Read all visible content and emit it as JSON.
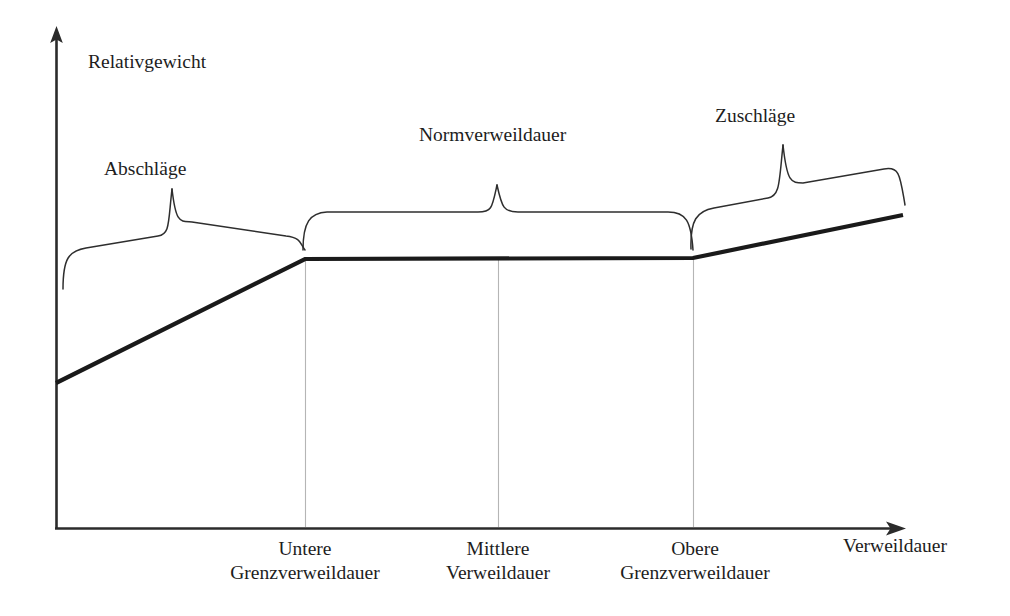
{
  "chart_data": {
    "type": "line",
    "title": "",
    "xlabel": "Verweildauer",
    "ylabel": "Relativgewicht",
    "grid": false,
    "legend_position": "none",
    "axis_arrows": true,
    "x_tick_labels": [
      {
        "id": "untere",
        "line1": "Untere",
        "line2": "Grenzverweildauer",
        "x_px": 305
      },
      {
        "id": "mittlere",
        "line1": "Mittlere",
        "line2": "Verweildauer",
        "x_px": 498
      },
      {
        "id": "obere",
        "line1": "Obere",
        "line2": "Grenzverweildauer",
        "x_px": 693
      }
    ],
    "series": [
      {
        "name": "Relativgewicht",
        "points_px": [
          {
            "x": 56,
            "y": 383
          },
          {
            "x": 305,
            "y": 259
          },
          {
            "x": 693,
            "y": 258
          },
          {
            "x": 903,
            "y": 215
          }
        ],
        "description": "Ansteigend bis zur unteren Grenzverweildauer, konstant bis zur oberen Grenzverweildauer, danach erneut ansteigend"
      }
    ],
    "braces": [
      {
        "id": "abschlaege",
        "label": "Abschläge",
        "from_x_px": 63,
        "to_x_px": 305
      },
      {
        "id": "normverweildauer",
        "label": "Normverweildauer",
        "from_x_px": 303,
        "to_x_px": 693
      },
      {
        "id": "zuschlaege",
        "label": "Zuschläge",
        "from_x_px": 691,
        "to_x_px": 905
      }
    ],
    "dropline_x_px": [
      305,
      498,
      693
    ],
    "colors": {
      "axis": "#2b2b2b",
      "curve": "#1a1a1a",
      "brace": "#2e2e2e",
      "dropline": "#b5b5b5",
      "background": "#ffffff"
    }
  },
  "axes": {
    "y_label": "Relativgewicht",
    "x_label": "Verweildauer"
  },
  "braces": {
    "abschlaege": "Abschläge",
    "normverweildauer": "Normverweildauer",
    "zuschlaege": "Zuschläge"
  },
  "ticks": {
    "untere": {
      "line1": "Untere",
      "line2": "Grenzverweildauer"
    },
    "mittlere": {
      "line1": "Mittlere",
      "line2": "Verweildauer"
    },
    "obere": {
      "line1": "Obere",
      "line2": "Grenzverweildauer"
    }
  }
}
